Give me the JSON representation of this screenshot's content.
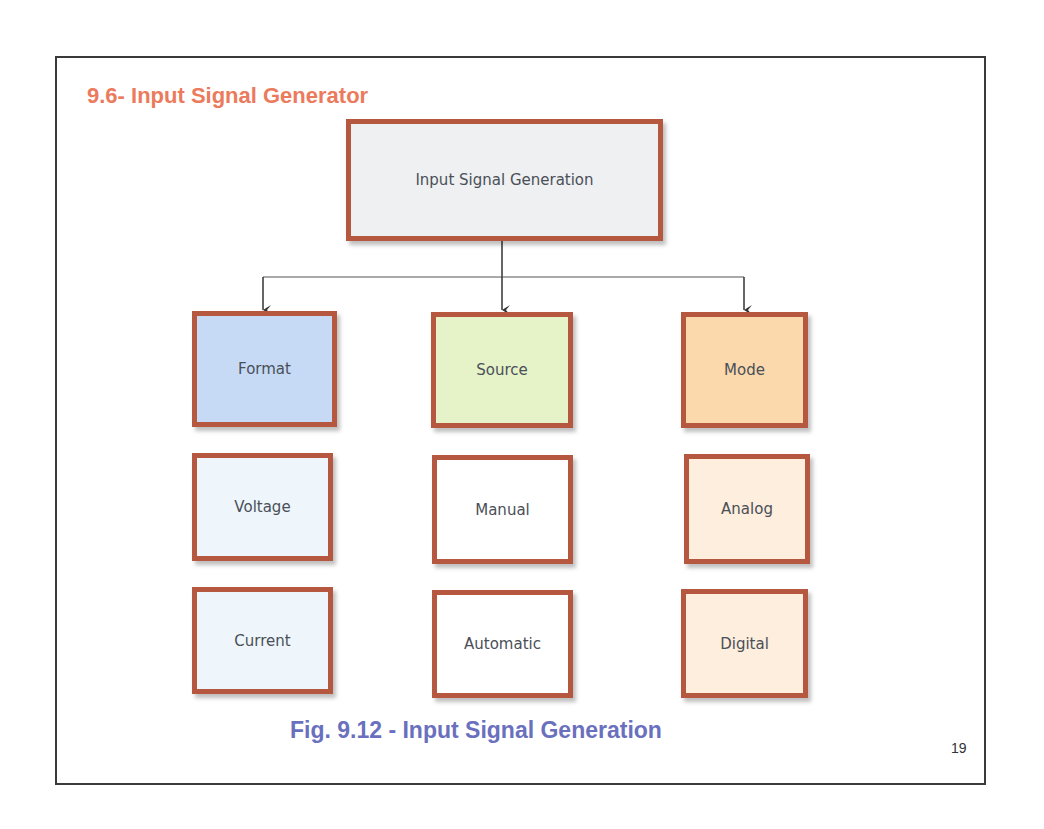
{
  "slide": {
    "title": "9.6- Input Signal Generator",
    "caption": "Fig. 9.12 - Input Signal Generation",
    "page_number": "19"
  },
  "colors": {
    "title": "#ec7a5c",
    "caption": "#6a70be",
    "node_border": "#b5583f",
    "root_fill": "#eef0f2",
    "format_fill": "#c6daf5",
    "source_fill": "#e6f3c8",
    "mode_fill": "#fbd9ad",
    "format_child_fill": "#eef6fb",
    "source_child_fill": "#ffffff",
    "mode_child_fill": "#fdeedd",
    "connector": "#333333"
  },
  "diagram": {
    "root": {
      "label": "Input Signal Generation"
    },
    "columns": [
      {
        "label": "Format",
        "children": [
          "Voltage",
          "Current"
        ]
      },
      {
        "label": "Source",
        "children": [
          "Manual",
          "Automatic"
        ]
      },
      {
        "label": "Mode",
        "children": [
          "Analog",
          "Digital"
        ]
      }
    ]
  }
}
